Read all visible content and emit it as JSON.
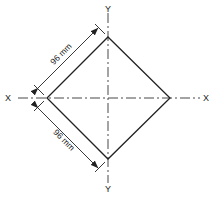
{
  "diagram": {
    "type": "square rotated 45 degrees with centre lines",
    "colors": {
      "line": "#222222",
      "background": "#ffffff"
    },
    "axes": {
      "x_left_label": "X",
      "x_right_label": "X",
      "y_top_label": "Y",
      "y_bottom_label": "Y"
    },
    "dimensions": {
      "upper_edge": "96 mm",
      "lower_edge": "96 mm"
    }
  }
}
